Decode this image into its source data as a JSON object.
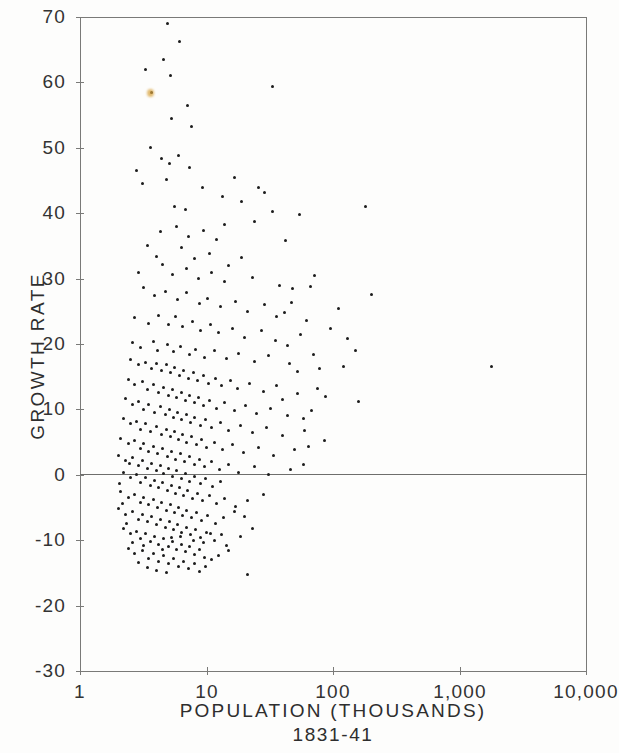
{
  "chart_data": {
    "type": "scatter",
    "title": "",
    "xlabel": "POPULATION  (THOUSANDS)",
    "xsublabel": "1831-41",
    "ylabel": "GROWTH  RATE",
    "xscale": "log",
    "yscale": "linear",
    "xlim": [
      1,
      10000
    ],
    "ylim": [
      -30,
      70
    ],
    "grid": false,
    "legend": null,
    "xticks": [
      1,
      10,
      100,
      1000,
      10000
    ],
    "xticklabels": [
      "1",
      "10",
      "100",
      "1,000",
      "10,000"
    ],
    "yticks": [
      -30,
      -20,
      -10,
      0,
      10,
      20,
      30,
      40,
      50,
      60,
      70
    ],
    "yticklabels": [
      "-30",
      "-20",
      "-10",
      "0",
      "10",
      "20",
      "30",
      "40",
      "50",
      "60",
      "70"
    ],
    "zero_reference_line": 0,
    "marker": "dot",
    "marker_color": "#1c1c1c",
    "point_count": 352,
    "accent_point_color": "#d8a23c",
    "accent_points": [
      [
        3.6,
        58.5
      ]
    ],
    "points": [
      [
        4.9,
        69.0
      ],
      [
        6.1,
        66.2
      ],
      [
        3.3,
        62.0
      ],
      [
        4.6,
        63.5
      ],
      [
        5.2,
        61.0
      ],
      [
        3.7,
        58.5
      ],
      [
        7.1,
        56.5
      ],
      [
        33.0,
        59.3
      ],
      [
        5.3,
        54.5
      ],
      [
        7.6,
        53.2
      ],
      [
        2.8,
        46.5
      ],
      [
        3.6,
        50.0
      ],
      [
        4.4,
        48.4
      ],
      [
        5.1,
        47.6
      ],
      [
        6.0,
        48.8
      ],
      [
        3.1,
        44.6
      ],
      [
        4.8,
        45.2
      ],
      [
        7.4,
        47.0
      ],
      [
        9.3,
        44.0
      ],
      [
        13.5,
        42.5
      ],
      [
        26.0,
        44.0
      ],
      [
        180.0,
        41.0
      ],
      [
        33.0,
        40.3
      ],
      [
        5.6,
        41.0
      ],
      [
        6.8,
        40.5
      ],
      [
        4.3,
        37.2
      ],
      [
        5.8,
        38.0
      ],
      [
        7.2,
        36.5
      ],
      [
        9.5,
        37.3
      ],
      [
        12.0,
        36.0
      ],
      [
        3.4,
        35.0
      ],
      [
        4.0,
        33.4
      ],
      [
        6.3,
        34.8
      ],
      [
        8.0,
        33.0
      ],
      [
        10.5,
        33.8
      ],
      [
        15.0,
        32.0
      ],
      [
        19.0,
        33.2
      ],
      [
        2.9,
        31.0
      ],
      [
        4.5,
        32.2
      ],
      [
        5.4,
        30.6
      ],
      [
        6.9,
        31.5
      ],
      [
        8.6,
        30.0
      ],
      [
        11.0,
        31.0
      ],
      [
        14.0,
        29.5
      ],
      [
        23.0,
        30.2
      ],
      [
        38.0,
        29.0
      ],
      [
        48.0,
        28.5
      ],
      [
        200.0,
        27.6
      ],
      [
        3.2,
        28.6
      ],
      [
        3.9,
        27.4
      ],
      [
        4.7,
        28.0
      ],
      [
        5.9,
        26.8
      ],
      [
        7.0,
        27.8
      ],
      [
        8.8,
        26.2
      ],
      [
        10.2,
        27.0
      ],
      [
        13.0,
        25.8
      ],
      [
        17.0,
        26.5
      ],
      [
        21.0,
        25.0
      ],
      [
        29.0,
        26.0
      ],
      [
        41.0,
        24.8
      ],
      [
        110.0,
        25.5
      ],
      [
        2.7,
        24.0
      ],
      [
        3.5,
        23.2
      ],
      [
        4.2,
        24.4
      ],
      [
        5.0,
        23.0
      ],
      [
        5.7,
        24.2
      ],
      [
        6.5,
        22.6
      ],
      [
        7.8,
        23.4
      ],
      [
        9.0,
        22.0
      ],
      [
        10.8,
        23.0
      ],
      [
        12.5,
        21.8
      ],
      [
        16.0,
        22.4
      ],
      [
        20.0,
        21.0
      ],
      [
        27.0,
        22.0
      ],
      [
        35.0,
        20.6
      ],
      [
        55.0,
        21.4
      ],
      [
        130.0,
        20.8
      ],
      [
        2.6,
        20.2
      ],
      [
        3.0,
        19.4
      ],
      [
        3.8,
        20.4
      ],
      [
        4.1,
        19.0
      ],
      [
        4.9,
        20.0
      ],
      [
        5.5,
        18.8
      ],
      [
        6.2,
        19.6
      ],
      [
        7.3,
        18.4
      ],
      [
        8.2,
        19.2
      ],
      [
        9.7,
        18.0
      ],
      [
        11.5,
        19.0
      ],
      [
        14.5,
        17.8
      ],
      [
        18.0,
        18.6
      ],
      [
        24.0,
        17.4
      ],
      [
        31.0,
        18.2
      ],
      [
        45.0,
        17.0
      ],
      [
        1800.0,
        16.5
      ],
      [
        2.5,
        17.6
      ],
      [
        2.9,
        16.8
      ],
      [
        3.3,
        17.2
      ],
      [
        3.7,
        16.2
      ],
      [
        4.0,
        17.0
      ],
      [
        4.4,
        16.0
      ],
      [
        4.8,
        16.8
      ],
      [
        5.2,
        15.6
      ],
      [
        5.6,
        16.4
      ],
      [
        6.1,
        15.2
      ],
      [
        6.6,
        16.0
      ],
      [
        7.2,
        14.8
      ],
      [
        7.9,
        15.6
      ],
      [
        8.5,
        14.4
      ],
      [
        9.4,
        15.2
      ],
      [
        10.4,
        14.0
      ],
      [
        11.8,
        14.8
      ],
      [
        13.2,
        13.6
      ],
      [
        15.5,
        14.4
      ],
      [
        17.5,
        13.2
      ],
      [
        22.0,
        14.0
      ],
      [
        28.0,
        12.8
      ],
      [
        36.0,
        13.6
      ],
      [
        52.0,
        12.4
      ],
      [
        75.0,
        13.2
      ],
      [
        2.4,
        14.6
      ],
      [
        2.7,
        13.8
      ],
      [
        3.1,
        14.2
      ],
      [
        3.4,
        13.0
      ],
      [
        3.8,
        13.8
      ],
      [
        4.2,
        12.6
      ],
      [
        4.6,
        13.4
      ],
      [
        5.0,
        12.2
      ],
      [
        5.4,
        13.0
      ],
      [
        5.8,
        11.8
      ],
      [
        6.3,
        12.6
      ],
      [
        6.8,
        11.4
      ],
      [
        7.4,
        12.2
      ],
      [
        8.0,
        11.0
      ],
      [
        8.7,
        11.8
      ],
      [
        9.5,
        10.6
      ],
      [
        10.6,
        11.4
      ],
      [
        12.0,
        10.2
      ],
      [
        13.8,
        11.0
      ],
      [
        16.5,
        9.8
      ],
      [
        20.5,
        10.6
      ],
      [
        25.0,
        9.4
      ],
      [
        32.0,
        10.2
      ],
      [
        44.0,
        9.0
      ],
      [
        68.0,
        9.8
      ],
      [
        2.3,
        11.6
      ],
      [
        2.6,
        10.8
      ],
      [
        2.9,
        11.2
      ],
      [
        3.2,
        10.0
      ],
      [
        3.5,
        10.8
      ],
      [
        3.9,
        9.6
      ],
      [
        4.3,
        10.4
      ],
      [
        4.7,
        9.2
      ],
      [
        5.1,
        10.0
      ],
      [
        5.5,
        8.8
      ],
      [
        5.9,
        9.6
      ],
      [
        6.4,
        8.4
      ],
      [
        6.9,
        9.2
      ],
      [
        7.5,
        8.0
      ],
      [
        8.1,
        8.8
      ],
      [
        8.9,
        7.6
      ],
      [
        9.8,
        8.4
      ],
      [
        11.0,
        7.2
      ],
      [
        12.8,
        8.0
      ],
      [
        14.8,
        6.8
      ],
      [
        18.5,
        7.6
      ],
      [
        23.0,
        6.4
      ],
      [
        30.0,
        7.2
      ],
      [
        40.0,
        6.0
      ],
      [
        60.0,
        6.8
      ],
      [
        2.2,
        8.6
      ],
      [
        2.5,
        7.8
      ],
      [
        2.8,
        8.2
      ],
      [
        3.0,
        7.0
      ],
      [
        3.3,
        7.8
      ],
      [
        3.6,
        6.6
      ],
      [
        4.0,
        7.4
      ],
      [
        4.4,
        6.2
      ],
      [
        4.8,
        7.0
      ],
      [
        5.2,
        5.8
      ],
      [
        5.6,
        6.6
      ],
      [
        6.0,
        5.4
      ],
      [
        6.5,
        6.2
      ],
      [
        7.0,
        5.0
      ],
      [
        7.6,
        5.8
      ],
      [
        8.3,
        4.6
      ],
      [
        9.1,
        5.4
      ],
      [
        10.0,
        4.2
      ],
      [
        11.5,
        5.0
      ],
      [
        13.5,
        3.8
      ],
      [
        16.0,
        4.6
      ],
      [
        19.5,
        3.4
      ],
      [
        26.0,
        4.2
      ],
      [
        34.0,
        3.0
      ],
      [
        50.0,
        3.8
      ],
      [
        2.1,
        5.6
      ],
      [
        2.4,
        4.8
      ],
      [
        2.7,
        5.2
      ],
      [
        3.0,
        4.0
      ],
      [
        3.2,
        4.8
      ],
      [
        3.5,
        3.6
      ],
      [
        3.8,
        4.4
      ],
      [
        4.1,
        3.2
      ],
      [
        4.5,
        4.0
      ],
      [
        4.9,
        2.8
      ],
      [
        5.3,
        3.6
      ],
      [
        5.7,
        2.4
      ],
      [
        6.2,
        3.2
      ],
      [
        6.7,
        2.0
      ],
      [
        7.3,
        2.8
      ],
      [
        8.0,
        1.6
      ],
      [
        8.8,
        2.4
      ],
      [
        9.6,
        1.2
      ],
      [
        10.9,
        2.0
      ],
      [
        12.6,
        0.8
      ],
      [
        15.0,
        1.6
      ],
      [
        18.0,
        0.4
      ],
      [
        24.0,
        1.2
      ],
      [
        31.0,
        0.0
      ],
      [
        46.0,
        0.8
      ],
      [
        58.0,
        1.5
      ],
      [
        2.0,
        3.0
      ],
      [
        2.3,
        2.2
      ],
      [
        2.6,
        2.6
      ],
      [
        2.9,
        1.4
      ],
      [
        3.1,
        2.2
      ],
      [
        3.4,
        1.0
      ],
      [
        3.7,
        1.8
      ],
      [
        4.0,
        0.6
      ],
      [
        4.3,
        1.4
      ],
      [
        4.6,
        0.2
      ],
      [
        5.0,
        1.0
      ],
      [
        5.4,
        -0.2
      ],
      [
        5.8,
        0.6
      ],
      [
        6.3,
        -0.6
      ],
      [
        6.8,
        0.2
      ],
      [
        7.4,
        -1.0
      ],
      [
        8.1,
        -0.2
      ],
      [
        8.9,
        -1.4
      ],
      [
        9.9,
        -0.6
      ],
      [
        11.2,
        -1.8
      ],
      [
        13.0,
        -1.0
      ],
      [
        2.2,
        0.4
      ],
      [
        2.5,
        -0.4
      ],
      [
        2.8,
        0.0
      ],
      [
        3.0,
        -1.2
      ],
      [
        3.3,
        -0.4
      ],
      [
        3.6,
        -1.6
      ],
      [
        3.9,
        -0.8
      ],
      [
        4.2,
        -2.0
      ],
      [
        4.5,
        -1.2
      ],
      [
        4.9,
        -2.4
      ],
      [
        5.3,
        -1.6
      ],
      [
        5.7,
        -2.8
      ],
      [
        6.1,
        -2.0
      ],
      [
        6.6,
        -3.2
      ],
      [
        7.1,
        -2.4
      ],
      [
        7.8,
        -3.6
      ],
      [
        8.5,
        -2.8
      ],
      [
        9.3,
        -4.0
      ],
      [
        10.5,
        -3.2
      ],
      [
        12.0,
        -4.4
      ],
      [
        14.0,
        -3.6
      ],
      [
        17.0,
        -4.8
      ],
      [
        21.0,
        -4.0
      ],
      [
        28.0,
        -3.0
      ],
      [
        2.1,
        -2.6
      ],
      [
        2.4,
        -3.4
      ],
      [
        2.7,
        -3.0
      ],
      [
        3.0,
        -4.2
      ],
      [
        3.2,
        -3.4
      ],
      [
        3.5,
        -4.6
      ],
      [
        3.8,
        -3.8
      ],
      [
        4.1,
        -5.0
      ],
      [
        4.4,
        -4.2
      ],
      [
        4.8,
        -5.4
      ],
      [
        5.2,
        -4.6
      ],
      [
        5.6,
        -5.8
      ],
      [
        6.0,
        -5.0
      ],
      [
        6.5,
        -6.2
      ],
      [
        7.0,
        -5.4
      ],
      [
        7.6,
        -6.6
      ],
      [
        8.3,
        -5.8
      ],
      [
        9.1,
        -7.0
      ],
      [
        10.2,
        -6.2
      ],
      [
        11.8,
        -7.4
      ],
      [
        13.6,
        -6.6
      ],
      [
        16.5,
        -5.6
      ],
      [
        20.0,
        -6.4
      ],
      [
        2.0,
        -5.2
      ],
      [
        2.3,
        -6.0
      ],
      [
        2.6,
        -5.6
      ],
      [
        2.9,
        -6.8
      ],
      [
        3.1,
        -6.0
      ],
      [
        3.4,
        -7.2
      ],
      [
        3.7,
        -6.4
      ],
      [
        4.0,
        -7.6
      ],
      [
        4.3,
        -6.8
      ],
      [
        4.7,
        -8.0
      ],
      [
        5.1,
        -7.2
      ],
      [
        5.5,
        -8.4
      ],
      [
        5.9,
        -7.6
      ],
      [
        6.4,
        -8.8
      ],
      [
        6.9,
        -8.0
      ],
      [
        7.5,
        -9.2
      ],
      [
        8.2,
        -8.4
      ],
      [
        9.0,
        -9.6
      ],
      [
        10.0,
        -8.8
      ],
      [
        11.5,
        -10.0
      ],
      [
        13.2,
        -9.2
      ],
      [
        2.2,
        -8.2
      ],
      [
        2.5,
        -9.0
      ],
      [
        2.8,
        -8.6
      ],
      [
        3.0,
        -9.8
      ],
      [
        3.3,
        -9.0
      ],
      [
        3.6,
        -10.2
      ],
      [
        3.9,
        -9.4
      ],
      [
        4.2,
        -10.6
      ],
      [
        4.6,
        -9.8
      ],
      [
        5.0,
        -11.0
      ],
      [
        5.4,
        -10.2
      ],
      [
        5.8,
        -11.4
      ],
      [
        6.3,
        -10.6
      ],
      [
        6.8,
        -11.8
      ],
      [
        7.4,
        -11.0
      ],
      [
        8.0,
        -12.2
      ],
      [
        8.8,
        -11.4
      ],
      [
        9.7,
        -12.6
      ],
      [
        2.4,
        -11.2
      ],
      [
        2.7,
        -12.0
      ],
      [
        3.1,
        -11.6
      ],
      [
        3.5,
        -12.8
      ],
      [
        3.8,
        -12.0
      ],
      [
        4.2,
        -13.2
      ],
      [
        4.6,
        -12.4
      ],
      [
        5.0,
        -13.6
      ],
      [
        5.5,
        -12.8
      ],
      [
        6.0,
        -14.0
      ],
      [
        6.6,
        -13.2
      ],
      [
        7.2,
        -14.4
      ],
      [
        8.0,
        -13.6
      ],
      [
        8.8,
        -14.8
      ],
      [
        9.8,
        -14.0
      ],
      [
        21.0,
        -15.3
      ],
      [
        4.0,
        -14.6
      ],
      [
        4.8,
        -15.0
      ],
      [
        3.4,
        -14.2
      ],
      [
        2.9,
        -13.4
      ],
      [
        2.6,
        -10.4
      ],
      [
        12.5,
        -12.4
      ],
      [
        15.0,
        -11.6
      ],
      [
        11.0,
        -13.0
      ],
      [
        14.5,
        -10.8
      ],
      [
        18.5,
        -9.4
      ],
      [
        23.0,
        -8.2
      ],
      [
        10.8,
        -9.0
      ],
      [
        9.4,
        -10.4
      ],
      [
        7.9,
        -10.0
      ],
      [
        6.2,
        -9.4
      ],
      [
        5.3,
        -9.6
      ],
      [
        4.5,
        -11.4
      ],
      [
        3.2,
        -10.8
      ],
      [
        2.35,
        -7.4
      ],
      [
        2.15,
        -4.4
      ],
      [
        2.05,
        -1.4
      ],
      [
        2.45,
        1.8
      ],
      [
        64.0,
        4.4
      ],
      [
        86.0,
        5.2
      ],
      [
        40.0,
        11.5
      ],
      [
        52.0,
        15.8
      ],
      [
        70.0,
        18.4
      ],
      [
        95.0,
        22.4
      ],
      [
        47.0,
        26.4
      ],
      [
        62.0,
        23.6
      ],
      [
        78.0,
        16.2
      ],
      [
        58.0,
        8.6
      ],
      [
        44.0,
        19.8
      ],
      [
        36.0,
        24.2
      ],
      [
        120.0,
        16.6
      ],
      [
        150.0,
        19.0
      ],
      [
        88.0,
        12.0
      ],
      [
        66.0,
        28.8
      ],
      [
        42.0,
        35.8
      ],
      [
        54.0,
        39.8
      ],
      [
        72.0,
        30.5
      ],
      [
        160.0,
        11.2
      ],
      [
        29.0,
        43.2
      ],
      [
        24.0,
        38.8
      ],
      [
        19.0,
        41.8
      ],
      [
        16.5,
        45.4
      ],
      [
        14.0,
        38.2
      ]
    ]
  }
}
